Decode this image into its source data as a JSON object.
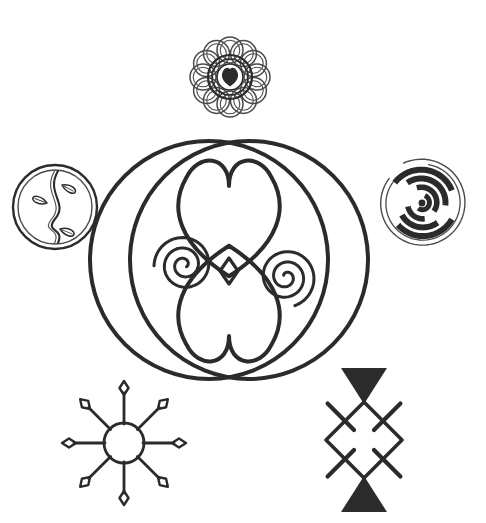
{
  "canvas": {
    "width": 486,
    "height": 523,
    "background_color": "#ffffff",
    "ink_color": "#2b2b2b",
    "ink_color_light": "#4a4a4a",
    "title": "Decorative line-art symbol sheet"
  },
  "artwork": {
    "style": "black ink line drawing on white, coloring-book style",
    "element_count": 5
  },
  "elements": {
    "top_rosette": {
      "name": "Flower rosette with heart center",
      "center_x": 230,
      "center_y": 77,
      "radius": 44,
      "petal_count": 12,
      "petal_radius": 13,
      "petal_ring_radius": 27,
      "inner_ring_radii": [
        22,
        18,
        13
      ],
      "core_heart_size": 17,
      "core_heart_filled": true
    },
    "left_medallion": {
      "name": "Vine and leaves medallion",
      "center_x": 55,
      "center_y": 207,
      "outer_radius": 42,
      "inner_radius": 37,
      "leaf_count": 3,
      "stem_style": "wavy double line"
    },
    "right_medallion": {
      "name": "Spiral labyrinth medallion",
      "center_x": 422,
      "center_y": 203,
      "outer_radius": 44,
      "ring_count": 5,
      "style": "dashed concentric spiral arcs"
    },
    "center_composition": {
      "name": "Double circle with twin hearts and spirals",
      "center_x": 229,
      "center_y": 260,
      "left_circle": {
        "cx": 209,
        "cy": 260,
        "r": 119
      },
      "right_circle": {
        "cx": 249,
        "cy": 260,
        "r": 119
      },
      "heart_top": {
        "cx": 229,
        "cy": 222,
        "width": 118,
        "note": "upright heart, apex down at node"
      },
      "heart_bottom": {
        "cx": 229,
        "cy": 300,
        "width": 118,
        "note": "inverted heart, apex up at node"
      },
      "node_diamond": {
        "cx": 229,
        "cy": 271,
        "half_width": 9,
        "half_height": 13
      },
      "spiral_left": {
        "cx": 184,
        "cy": 265,
        "turns": 2.6,
        "direction": "inward counter-clockwise"
      },
      "spiral_right": {
        "cx": 286,
        "cy": 277,
        "turns": 2.6,
        "direction": "inward clockwise"
      }
    },
    "bottom_left_star": {
      "name": "Eight-ray sun star",
      "center_x": 124,
      "center_y": 443,
      "hub_radius": 20,
      "ray_count": 8,
      "ray_length": 50,
      "tip_shape": "diamond"
    },
    "bottom_right_diamond": {
      "name": "Diamond with crossed bars and filled triangles",
      "center_x": 364,
      "center_y": 440,
      "diamond_half_width": 38,
      "diamond_half_height": 38,
      "cross_arm_length": 52,
      "triangle_top_filled": true,
      "triangle_bottom_filled": true
    }
  }
}
